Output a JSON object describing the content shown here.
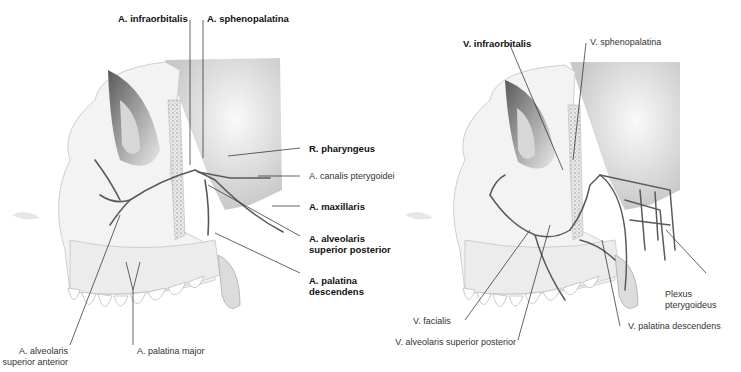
{
  "left_figure": {
    "title": "Arteries of the maxillary region",
    "labels": {
      "infraorbitalis": "A. infraorbitalis",
      "sphenopalatina": "A. sphenopalatina",
      "pharyngeus": "R. pharyngeus",
      "canalis_pterygoidei": "A. canalis pterygoidei",
      "maxillaris": "A. maxillaris",
      "alv_sup_post_1": "A. alveolaris",
      "alv_sup_post_2": "superior posterior",
      "palatina_desc_1": "A. palatina",
      "palatina_desc_2": "descendens",
      "alv_sup_ant_1": "A. alveolaris",
      "alv_sup_ant_2": "superior anterior",
      "palatina_major": "A. palatina major"
    }
  },
  "right_figure": {
    "title": "Veins of the maxillary region",
    "labels": {
      "infraorbitalis": "V. infraorbitalis",
      "sphenopalatina": "V. sphenopalatina",
      "plexus_1": "Plexus",
      "plexus_2": "pterygoideus",
      "facialis": "V. facialis",
      "palatina_desc": "V. palatina descendens",
      "alv_sup_post": "V. alveolaris superior posterior"
    }
  },
  "colors": {
    "vessel": "#5a5a5a",
    "bone_light": "#f2f2f2",
    "bone_shadow": "#bdbdbd",
    "leader_line": "#222222"
  }
}
